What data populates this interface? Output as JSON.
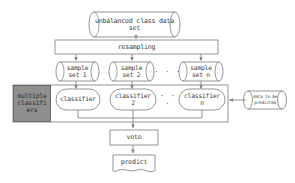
{
  "diagram": {
    "colors": {
      "stroke": "#7a7a7a",
      "text": "#3c3c3c",
      "gray_fill": "#8f8f8f",
      "background": "#ffffff"
    },
    "nodes": {
      "data_source": {
        "label": "unbalanced class data\nset",
        "shape": "cylinder"
      },
      "resampling": {
        "label": "resampling",
        "shape": "rectangle"
      },
      "sample_sets": [
        {
          "label": "sample\nset 1",
          "shape": "cylinder"
        },
        {
          "label": "sample\nset 2",
          "shape": "cylinder"
        },
        {
          "label": "sample\nset n",
          "shape": "cylinder"
        }
      ],
      "sample_ellipsis": "· · ·",
      "group_label": {
        "label": "multiple classifi ers",
        "lines": [
          "multiple",
          "classifi",
          "ers"
        ],
        "shape": "filled-box"
      },
      "classifiers": [
        {
          "label": "classifier",
          "shape": "stadium"
        },
        {
          "label": "classifier\n2",
          "shape": "stadium"
        },
        {
          "label": "classifier\nn",
          "shape": "stadium"
        }
      ],
      "classifier_ellipsis": "· · ·",
      "predict_input": {
        "label": "data to be\npredicted",
        "shape": "cylinder"
      },
      "vote": {
        "label": "vote",
        "shape": "rectangle"
      },
      "predict": {
        "label": "predict",
        "shape": "document"
      }
    }
  }
}
